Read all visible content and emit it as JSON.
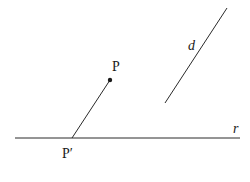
{
  "diagram": {
    "labels": {
      "point_p": "P",
      "point_p_prime": "P′",
      "line_d": "d",
      "line_r": "r"
    },
    "colors": {
      "stroke": "#2a2a2a",
      "background": "#ffffff"
    }
  }
}
